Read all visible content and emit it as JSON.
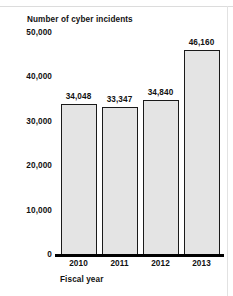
{
  "chart_data": {
    "type": "bar",
    "title": "Number of cyber incidents",
    "xlabel": "Fiscal year",
    "ylabel": "",
    "categories": [
      "2010",
      "2011",
      "2012",
      "2013"
    ],
    "values": [
      34048,
      33347,
      34840,
      46160
    ],
    "value_labels": [
      "34,048",
      "33,347",
      "34,840",
      "46,160"
    ],
    "ylim": [
      0,
      50000
    ],
    "ytick_values": [
      50000,
      40000,
      30000,
      20000,
      10000,
      0
    ],
    "ytick_labels": [
      "50,000",
      "40,000",
      "30,000",
      "20,000",
      "10,000",
      "0"
    ],
    "grid": false,
    "legend": null,
    "series": [
      {
        "name": "Number of cyber incidents",
        "values": [
          34048,
          33347,
          34840,
          46160
        ]
      }
    ],
    "colors": {
      "bar_fill": "#e4e4e4",
      "bar_outline": "#1a1a1a",
      "axis": "#000000",
      "text": "#111111",
      "background": "#ffffff"
    }
  }
}
